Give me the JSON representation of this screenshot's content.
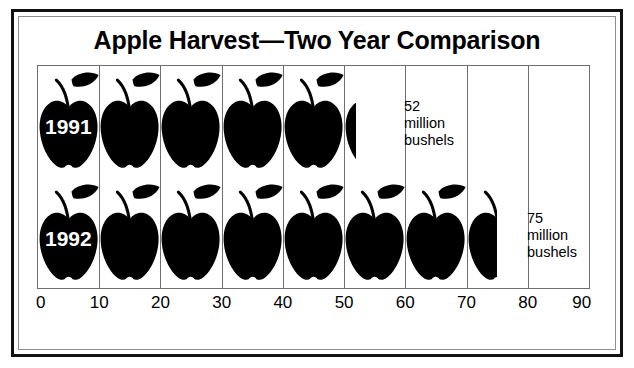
{
  "chart_data": {
    "type": "bar",
    "subtype": "pictograph",
    "title": "Apple Harvest—Two Year Comparison",
    "xlabel": "",
    "ylabel": "",
    "xlim": [
      0,
      90
    ],
    "xticks": [
      0,
      10,
      20,
      30,
      40,
      50,
      60,
      70,
      80,
      90
    ],
    "xtick_labels": [
      "0",
      "10",
      "20",
      "30",
      "40",
      "50",
      "60",
      "70",
      "80",
      "90"
    ],
    "grid": true,
    "legend": "none",
    "icon": "apple-icon",
    "icon_unit_value": 10,
    "units": "million bushels",
    "categories": [
      "1991",
      "1992"
    ],
    "values": [
      52,
      75
    ],
    "series": [
      {
        "name": "Apple harvest",
        "values": [
          52,
          75
        ]
      }
    ],
    "annotations": [
      {
        "category": "1991",
        "text": "52\nmillion\nbushels",
        "value": 52
      },
      {
        "category": "1992",
        "text": "75\nmillion\nbushels",
        "value": 75
      }
    ],
    "colors": {
      "icon": "#000000",
      "background": "#ffffff",
      "grid": "#6f6f6f",
      "frame": "#111111",
      "label_on_icon": "#ffffff"
    }
  },
  "rows": [
    {
      "year_label": "1991",
      "value": 52,
      "icon_count_full": 5,
      "icon_count_partial": 0.2,
      "note_lines": "52\nmillion\nbushels"
    },
    {
      "year_label": "1992",
      "value": 75,
      "icon_count_full": 7,
      "icon_count_partial": 0.5,
      "note_lines": "75\nmillion\nbushels"
    }
  ],
  "axis": {
    "ticks": [
      "0",
      "10",
      "20",
      "30",
      "40",
      "50",
      "60",
      "70",
      "80",
      "90"
    ]
  }
}
